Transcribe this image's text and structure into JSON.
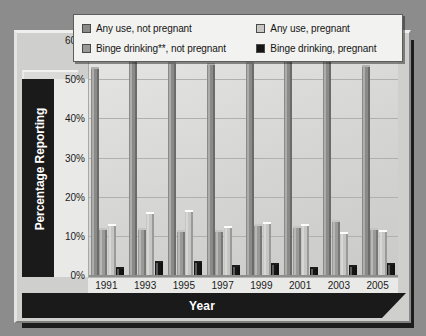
{
  "chart_data": {
    "type": "bar",
    "title": "",
    "xlabel": "Year",
    "ylabel": "Percentage Reporting",
    "categories": [
      "1991",
      "1993",
      "1995",
      "1997",
      "1999",
      "2001",
      "2003",
      "2005"
    ],
    "ylim": [
      0,
      60
    ],
    "ytick_labels": [
      "0%",
      "10%",
      "20%",
      "30%",
      "40%",
      "50%",
      "60%"
    ],
    "ytick_values": [
      0,
      10,
      20,
      30,
      40,
      50,
      60
    ],
    "grid": true,
    "legend_position": "top",
    "series": [
      {
        "name": "Any use, not pregnant",
        "color": "#8a8a88",
        "values": [
          52.5,
          56.0,
          54.0,
          53.5,
          54.0,
          55.5,
          56.5,
          53.0
        ]
      },
      {
        "name": "Binge drinking**, not pregnant",
        "color": "#9a9a98",
        "values": [
          11.5,
          11.5,
          11.0,
          11.0,
          12.5,
          12.0,
          13.5,
          11.5
        ]
      },
      {
        "name": "Any use, pregnant",
        "color": "#c6c6c4",
        "values": [
          12.5,
          15.5,
          16.0,
          12.0,
          13.0,
          12.5,
          10.5,
          11.0
        ]
      },
      {
        "name": "Binge drinking, pregnant",
        "color": "#161616",
        "values": [
          1.5,
          3.0,
          3.0,
          2.0,
          2.5,
          1.5,
          2.0,
          2.5
        ]
      }
    ]
  },
  "legend": {
    "items": [
      {
        "label": "Any use, not pregnant",
        "color": "#8a8a88"
      },
      {
        "label": "Any use, pregnant",
        "color": "#c6c6c4"
      },
      {
        "label": "Binge drinking**, not pregnant",
        "color": "#9a9a98"
      },
      {
        "label": "Binge drinking, pregnant",
        "color": "#161616"
      }
    ]
  },
  "axes": {
    "y_title": "Percentage Reporting",
    "x_title": "Year"
  }
}
